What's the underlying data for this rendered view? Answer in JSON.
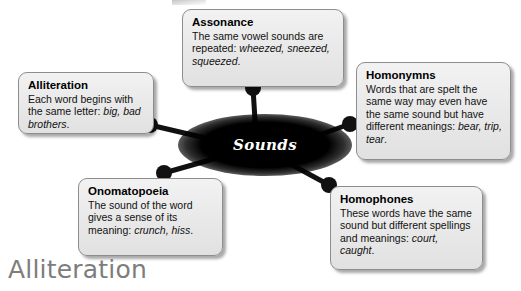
{
  "diagram": {
    "hub": {
      "label": "Sounds"
    },
    "nodes": [
      {
        "id": "alliteration",
        "title": "Alliteration",
        "body_html": "Each word begins with the same letter: <i>big, bad brothers</i>."
      },
      {
        "id": "assonance",
        "title": "Assonance",
        "body_html": "The same vowel sounds are repeated: <i>wheezed, sneezed, squeezed</i>."
      },
      {
        "id": "homonymns",
        "title": "Homonymns",
        "body_html": "Words that are spelt the same way may even have the same sound but have different meanings: <i>bear, trip, tear</i>."
      },
      {
        "id": "onomatopoeia",
        "title": "Onomatopoeia",
        "body_html": "The sound of the word gives a sense of its meaning: <i>crunch, hiss</i>."
      },
      {
        "id": "homophones",
        "title": "Homophones",
        "body_html": "These words have the same sound but different spellings and meanings: <i>court, caught</i>."
      }
    ],
    "connectors": [
      {
        "id": "connector-alliteration",
        "dot_x": 150,
        "dot_y": 125,
        "hub_x": 248,
        "hub_y": 148
      },
      {
        "id": "connector-assonance",
        "dot_x": 253,
        "dot_y": 88,
        "hub_x": 256,
        "hub_y": 136
      },
      {
        "id": "connector-homonymns",
        "dot_x": 350,
        "dot_y": 124,
        "hub_x": 288,
        "hub_y": 146
      },
      {
        "id": "connector-onomatopoeia",
        "dot_x": 164,
        "dot_y": 173,
        "hub_x": 238,
        "hub_y": 152
      },
      {
        "id": "connector-homophones",
        "dot_x": 329,
        "dot_y": 185,
        "hub_x": 281,
        "hub_y": 159
      }
    ],
    "dot_radius": 8,
    "line_width": 5,
    "colors": {
      "connector": "#111111",
      "hub_fill": "#000000",
      "hub_text": "#ffffff",
      "box_fill": "#eaeaea",
      "box_border": "#8d8d8d",
      "caption_text": "#7d7d7d"
    }
  },
  "caption": {
    "text": "Alliteration"
  }
}
